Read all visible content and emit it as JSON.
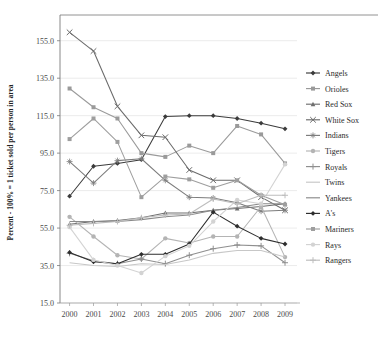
{
  "chart_data": {
    "type": "line",
    "title": "",
    "xlabel": "",
    "ylabel": "Percent - 100% = 1 ticket sold per person in area",
    "x": [
      2000,
      2001,
      2002,
      2003,
      2004,
      2005,
      2006,
      2007,
      2008,
      2009
    ],
    "xticklabels": [
      "2000",
      "2001",
      "2002",
      "2003",
      "2004",
      "2005",
      "2006",
      "2007",
      "2008",
      "2009"
    ],
    "yticklabels": [
      "15.0",
      "35.0",
      "55.0",
      "75.0",
      "95.0",
      "115.0",
      "135.0",
      "155.0"
    ],
    "yticks": [
      15,
      35,
      55,
      75,
      95,
      115,
      135,
      155
    ],
    "ylim": [
      15,
      165
    ],
    "xlim": [
      1999.6,
      2009.5
    ],
    "grid": "horizontal",
    "legend_position": "right",
    "series": [
      {
        "name": "Angels",
        "color": "#3b3b3b",
        "marker": "diamond",
        "values": [
          72.0,
          88.0,
          89.5,
          91.5,
          114.5,
          115.0,
          115.0,
          113.5,
          111.0,
          108.0
        ]
      },
      {
        "name": "Orioles",
        "color": "#9a9a9a",
        "marker": "square",
        "values": [
          129.5,
          119.5,
          113.5,
          95.0,
          93.0,
          99.0,
          95.0,
          109.5,
          105.0,
          89.5
        ]
      },
      {
        "name": "Red Sox",
        "color": "#6e6e6e",
        "marker": "triangle",
        "values": [
          57.0,
          58.5,
          59.0,
          60.5,
          63.0,
          63.0,
          64.5,
          65.5,
          66.5,
          68.0
        ]
      },
      {
        "name": "White Sox",
        "color": "#6b6b6b",
        "marker": "x",
        "values": [
          159.5,
          149.5,
          120.0,
          104.5,
          103.5,
          86.0,
          80.5,
          80.5,
          71.5,
          64.5
        ]
      },
      {
        "name": "Indians",
        "color": "#7d7d7d",
        "marker": "star",
        "values": [
          90.5,
          79.0,
          91.0,
          92.0,
          80.5,
          71.5,
          71.0,
          68.5,
          64.0,
          64.5
        ]
      },
      {
        "name": "Tigers",
        "color": "#b4b4b4",
        "marker": "circle",
        "values": [
          61.0,
          50.5,
          40.5,
          38.5,
          49.5,
          47.0,
          50.5,
          50.5,
          66.5,
          39.5
        ]
      },
      {
        "name": "Royals",
        "color": "#8f8f8f",
        "marker": "plus",
        "values": [
          41.5,
          37.5,
          36.0,
          38.5,
          36.0,
          40.5,
          44.0,
          46.0,
          45.5,
          36.5
        ]
      },
      {
        "name": "Twins",
        "color": "#c7c7c7",
        "marker": "none",
        "values": [
          36.5,
          35.0,
          34.5,
          36.0,
          35.5,
          38.0,
          41.5,
          43.0,
          43.0,
          39.5
        ]
      },
      {
        "name": "Yankees",
        "color": "#8a8a8a",
        "marker": "none",
        "values": [
          58.5,
          58.5,
          58.5,
          59.5,
          61.0,
          62.0,
          64.5,
          66.0,
          68.0,
          68.0
        ]
      },
      {
        "name": "A's",
        "color": "#2e2e2e",
        "marker": "diamond",
        "values": [
          42.0,
          37.0,
          36.0,
          41.0,
          41.0,
          46.5,
          63.5,
          56.0,
          49.5,
          46.5
        ]
      },
      {
        "name": "Mariners",
        "color": "#9e9e9e",
        "marker": "square",
        "values": [
          102.5,
          113.5,
          101.0,
          71.5,
          82.5,
          81.0,
          76.5,
          80.5,
          72.5,
          67.5
        ]
      },
      {
        "name": "Rays",
        "color": "#d3d3d3",
        "marker": "circle",
        "values": [
          55.5,
          38.0,
          35.0,
          31.0,
          40.0,
          45.5,
          58.5,
          70.0,
          68.0,
          89.0
        ]
      },
      {
        "name": "Rangers",
        "color": "#bdbdbd",
        "marker": "plus",
        "values": [
          56.5,
          57.5,
          58.5,
          60.5,
          62.0,
          62.5,
          70.5,
          68.0,
          72.5,
          72.5
        ]
      }
    ]
  },
  "legend": {
    "items": [
      {
        "label": "Angels"
      },
      {
        "label": "Orioles"
      },
      {
        "label": "Red Sox"
      },
      {
        "label": "White Sox"
      },
      {
        "label": "Indians"
      },
      {
        "label": "Tigers"
      },
      {
        "label": "Royals"
      },
      {
        "label": "Twins"
      },
      {
        "label": "Yankees"
      },
      {
        "label": "A's"
      },
      {
        "label": "Mariners"
      },
      {
        "label": "Rays"
      },
      {
        "label": "Rangers"
      }
    ]
  }
}
